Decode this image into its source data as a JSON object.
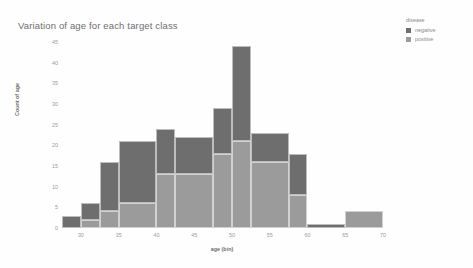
{
  "chart_data": {
    "type": "bar",
    "title": "Variation of age for each target class",
    "xlabel": "age (bin)",
    "ylabel": "Count of age",
    "stacked": true,
    "grid": false,
    "legend_position": "right",
    "legend_title": "disease",
    "xlim": [
      27.5,
      70
    ],
    "ylim": [
      0,
      45
    ],
    "yticks": [
      0,
      5,
      10,
      15,
      20,
      25,
      30,
      35,
      40,
      45
    ],
    "xticks": [
      30,
      35,
      40,
      45,
      50,
      55,
      60,
      65,
      70
    ],
    "bins": [
      {
        "start": 27.5,
        "end": 30.0,
        "negative": 3,
        "positive": 0
      },
      {
        "start": 30.0,
        "end": 32.5,
        "negative": 4,
        "positive": 2
      },
      {
        "start": 32.5,
        "end": 35.0,
        "negative": 12,
        "positive": 4
      },
      {
        "start": 35.0,
        "end": 40.0,
        "negative": 15,
        "positive": 6
      },
      {
        "start": 40.0,
        "end": 42.5,
        "negative": 11,
        "positive": 13
      },
      {
        "start": 42.5,
        "end": 47.5,
        "negative": 9,
        "positive": 13
      },
      {
        "start": 47.5,
        "end": 50.0,
        "negative": 11,
        "positive": 18
      },
      {
        "start": 50.0,
        "end": 52.5,
        "negative": 23,
        "positive": 21
      },
      {
        "start": 52.5,
        "end": 57.5,
        "negative": 7,
        "positive": 16
      },
      {
        "start": 57.5,
        "end": 60.0,
        "negative": 10,
        "positive": 8
      },
      {
        "start": 60.0,
        "end": 65.0,
        "negative": 1,
        "positive": 0
      },
      {
        "start": 65.0,
        "end": 70.0,
        "negative": 0,
        "positive": 4
      }
    ],
    "series": [
      {
        "name": "negative",
        "color": "#6e6e6e",
        "values": [
          3,
          4,
          12,
          15,
          11,
          9,
          11,
          23,
          7,
          10,
          1,
          0
        ]
      },
      {
        "name": "positive",
        "color": "#9b9b9b",
        "values": [
          0,
          2,
          4,
          6,
          13,
          13,
          18,
          21,
          16,
          8,
          0,
          4
        ]
      }
    ]
  },
  "legend": {
    "title": "disease",
    "items": [
      {
        "label": "negative",
        "color": "#6e6e6e"
      },
      {
        "label": "positive",
        "color": "#9b9b9b"
      }
    ]
  }
}
